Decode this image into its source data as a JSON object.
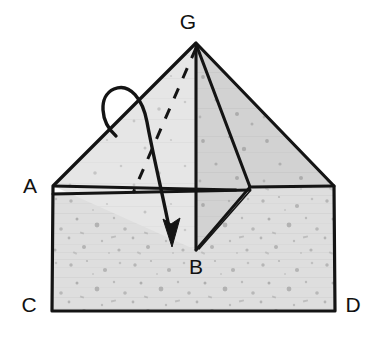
{
  "figure": {
    "kind": "geometry-diagram",
    "colors": {
      "background": "#ffffff",
      "stroke": "#141414",
      "fill": "#dddddd",
      "fill_dark": "#c9c9c9",
      "fill_light": "#e6e6e6",
      "label": "#111111",
      "speckle": "#9a9a9a"
    },
    "labels": [
      {
        "id": "label-G",
        "text": "G",
        "x": 188,
        "y": 29
      },
      {
        "id": "label-A",
        "text": "A",
        "x": 24,
        "y": 193
      },
      {
        "id": "label-B",
        "text": "B",
        "x": 188,
        "y": 274
      },
      {
        "id": "label-C",
        "text": "C",
        "x": 22,
        "y": 312
      },
      {
        "id": "label-D",
        "text": "D",
        "x": 345,
        "y": 312
      }
    ],
    "points": {
      "G": [
        196,
        43
      ],
      "A": [
        53,
        186
      ],
      "B": [
        196,
        250
      ],
      "C": [
        52,
        311
      ],
      "D": [
        335,
        311
      ],
      "E": [
        334,
        186
      ],
      "F": [
        250,
        187
      ],
      "A2": [
        53,
        193
      ],
      "M": [
        236,
        194
      ]
    },
    "arrow": {
      "name": "rotation-arrow",
      "description": "curved looping arrow from upper left folding down to B",
      "tip": [
        172,
        243
      ],
      "loop_top": [
        118,
        88
      ]
    },
    "dashed_edge": {
      "name": "hidden-edge-G-to-rear",
      "from": [
        196,
        43
      ],
      "to": [
        133,
        192
      ]
    }
  }
}
